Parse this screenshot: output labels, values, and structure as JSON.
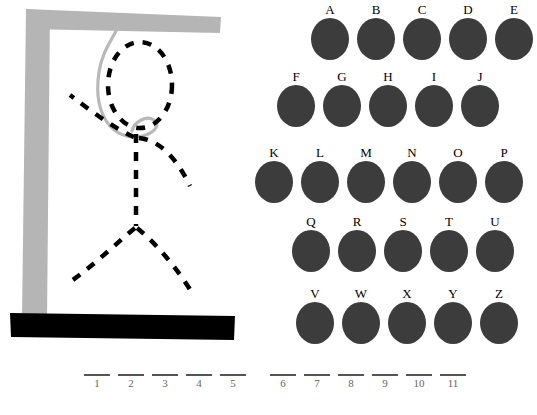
{
  "game": {
    "title": "Hangman",
    "colors": {
      "gallows": "#b5b5b5",
      "base": "#000000",
      "rope": "#b9b9b9",
      "figure": "#000000",
      "letter_disc": "#3c3c3c",
      "blank_line": "#555555",
      "background": "#ffffff"
    }
  },
  "gallows": {
    "post_name": "gallows-post",
    "beam_name": "gallows-beam",
    "base_name": "gallows-base",
    "rope_name": "noose-rope"
  },
  "figure": {
    "parts": [
      {
        "name": "head",
        "shown": true
      },
      {
        "name": "torso",
        "shown": true
      },
      {
        "name": "left-arm",
        "shown": true
      },
      {
        "name": "right-arm",
        "shown": true
      },
      {
        "name": "left-leg",
        "shown": true
      },
      {
        "name": "right-leg",
        "shown": true
      }
    ],
    "parts_shown": 6,
    "parts_total": 6
  },
  "keyboard": {
    "rows": [
      {
        "letters": [
          "A",
          "B",
          "C",
          "D",
          "E"
        ]
      },
      {
        "letters": [
          "F",
          "G",
          "H",
          "I",
          "J"
        ]
      },
      {
        "letters": [
          "K",
          "L",
          "M",
          "N",
          "O",
          "P"
        ]
      },
      {
        "letters": [
          "Q",
          "R",
          "S",
          "T",
          "U"
        ]
      },
      {
        "letters": [
          "V",
          "W",
          "X",
          "Y",
          "Z"
        ]
      }
    ]
  },
  "word_blanks": {
    "words": [
      {
        "numbers": [
          "1",
          "2",
          "3",
          "4",
          "5"
        ],
        "letters": [
          "",
          "",
          "",
          "",
          ""
        ]
      },
      {
        "numbers": [
          "6",
          "7",
          "8",
          "9",
          "10",
          "11"
        ],
        "letters": [
          "",
          "",
          "",
          "",
          "",
          ""
        ]
      }
    ],
    "total_blanks": 11
  }
}
